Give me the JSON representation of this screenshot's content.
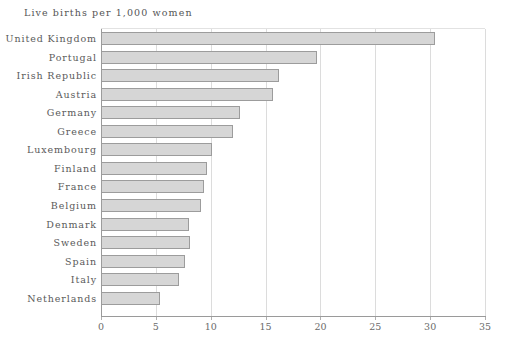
{
  "chart_data": {
    "type": "bar",
    "orientation": "horizontal",
    "title": "Live  births  per  1,000  women",
    "xlabel": "",
    "ylabel": "",
    "xlim": [
      0,
      35
    ],
    "xticks": [
      0,
      5,
      10,
      15,
      20,
      25,
      30,
      35
    ],
    "grid": "vertical",
    "legend": "none",
    "highlight_category": "United Kingdom",
    "colors": {
      "bar_fill": "#d6d6d6",
      "bar_border": "#9c9c9c",
      "highlight_fill": "#7f7f7f",
      "highlight_border": "#5d5d5d",
      "gridline": "#dcdcdc",
      "axis": "#9a9a9a",
      "text": "#5a5a5a"
    },
    "categories": [
      "United  Kingdom",
      "Portugal",
      "Irish  Republic",
      "Austria",
      "Germany",
      "Greece",
      "Luxembourg",
      "Finland",
      "France",
      "Belgium",
      "Denmark",
      "Sweden",
      "Spain",
      "Italy",
      "Netherlands"
    ],
    "values": [
      30.4,
      19.7,
      16.2,
      15.7,
      12.7,
      12.0,
      10.1,
      9.7,
      9.4,
      9.1,
      8.0,
      8.1,
      7.7,
      7.1,
      5.4
    ]
  }
}
